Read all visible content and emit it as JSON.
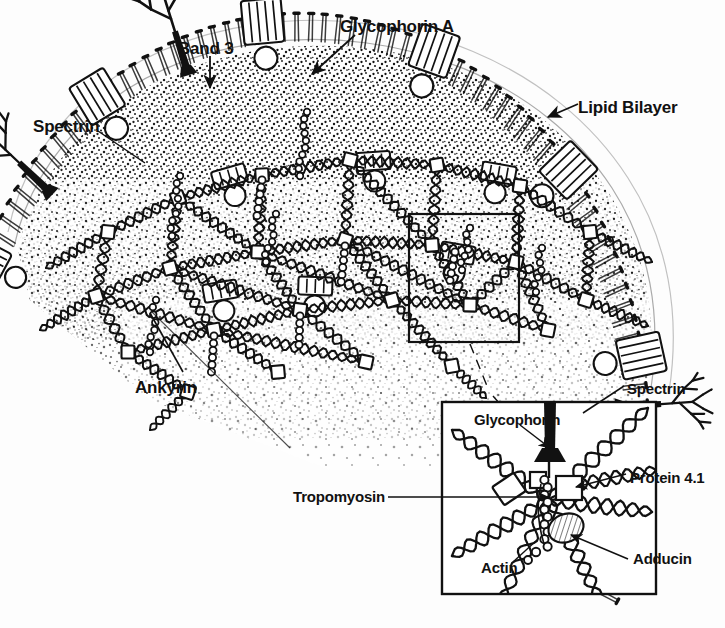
{
  "figure": {
    "style": "black-and-white line drawing with stipple shading",
    "background_color": "#fdfdfd",
    "ink_color": "#111111"
  },
  "main_labels": [
    {
      "id": "spectrin",
      "text": "Spectrin",
      "x": 33,
      "y": 118,
      "leader": "line-to-membrane-strand"
    },
    {
      "id": "band3",
      "text": "Band 3",
      "x": 178,
      "y": 40,
      "leader": "arrow-down-to-channel"
    },
    {
      "id": "glycophorin_a",
      "text": "Glycophorin A",
      "x": 340,
      "y": 18,
      "leader": "arrow-down-left-to-glycoprotein"
    },
    {
      "id": "lipid_bilayer",
      "text": "Lipid Bilayer",
      "x": 578,
      "y": 99,
      "leader": "arrow-down-left-to-bilayer"
    },
    {
      "id": "ankyrin",
      "text": "Ankyrin",
      "x": 135,
      "y": 379,
      "leader": "line-up-right-to-ankyrin-bead-chain"
    }
  ],
  "inset_labels": [
    {
      "id": "inset_spectrin",
      "text": "Spectrin",
      "x": 627,
      "y": 381,
      "leader": "line-down-left-into-box"
    },
    {
      "id": "inset_glycophorin",
      "text": "Glycophorin",
      "x": 474,
      "y": 412,
      "leader": "arrow-down-right"
    },
    {
      "id": "inset_protein41",
      "text": "Protein 4.1",
      "x": 630,
      "y": 470,
      "leader": "arrow-left-to-square"
    },
    {
      "id": "inset_tropomyosin",
      "text": "Tropomyosin",
      "x": 293,
      "y": 493,
      "leader": "arrow-right-into-box"
    },
    {
      "id": "inset_actin",
      "text": "Actin",
      "x": 481,
      "y": 564,
      "leader": "line-up-right-to-bead"
    },
    {
      "id": "inset_adducin",
      "text": "Adducin",
      "x": 633,
      "y": 555,
      "leader": "arrow-up-left-to-hatched-wedge"
    }
  ],
  "inset_box": {
    "x": 442,
    "y": 402,
    "width": 214,
    "height": 192,
    "border_color": "#111111",
    "border_width": 2
  },
  "callout_box": {
    "x": 409,
    "y": 214,
    "width": 110,
    "height": 128,
    "border_color": "#111111",
    "border_width": 2,
    "note": "magnified region of the membrane skeleton, connected to the inset by a dashed leader"
  },
  "structures": {
    "bilayer": {
      "name": "lipid-bilayer",
      "description": "arc of phospholipid head-and-tail pairs forming the outer cell boundary"
    },
    "band3_channels": {
      "name": "band-3-channel",
      "count": 9,
      "description": "striped cylinder spanning the bilayer"
    },
    "glycophorins": {
      "name": "glycophorin",
      "count": 3,
      "description": "membrane protein with branched oligosaccharide tree on the outer face"
    },
    "spectrin_strands": {
      "name": "spectrin-tetramer",
      "description": "twisted double-helical rope forming the hexagonal lattice"
    },
    "ankyrin_chains": {
      "name": "ankyrin-bead-chain",
      "description": "beaded chain linking band 3 to spectrin"
    },
    "protein41_squares": {
      "name": "protein-4-1",
      "description": "small open square at junctional complexes"
    },
    "actin_nodes": {
      "name": "actin-protofilament",
      "description": "short beaded filament at spectrin junctions"
    },
    "adducin_wedge": {
      "name": "adducin",
      "description": "hatched wedge capping the actin filament"
    },
    "circles": {
      "name": "globular-protein-circle",
      "description": "open circle beneath each band 3 channel"
    }
  }
}
